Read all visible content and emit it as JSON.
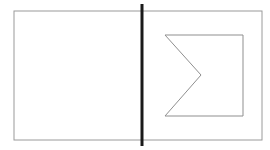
{
  "canvas": {
    "width": 270,
    "height": 150,
    "background_color": "#ffffff",
    "title": "Split rectangle with sigma chevron outline"
  },
  "figure": {
    "outer_rectangle": {
      "label": "outer-frame",
      "x": 14,
      "y": 11,
      "width": 248,
      "height": 129,
      "stroke_color": "#9a9a9a",
      "stroke_width": 1,
      "fill": "none"
    },
    "divider_line": {
      "label": "vertical-divider",
      "x": 142,
      "y_start": 4,
      "y_end": 146,
      "stroke_color": "#1a1a1a",
      "stroke_width": 3,
      "orientation": "vertical"
    },
    "sigma_polygon": {
      "label": "sigma-chevron",
      "points": "165,35 243,35 243,116 165,116 201,75",
      "vertices": [
        {
          "name": "top-left",
          "x": 165,
          "y": 35
        },
        {
          "name": "top-right",
          "x": 243,
          "y": 35
        },
        {
          "name": "bottom-right",
          "x": 243,
          "y": 116
        },
        {
          "name": "bottom-left",
          "x": 165,
          "y": 116
        },
        {
          "name": "notch-tip",
          "x": 201,
          "y": 75
        }
      ],
      "stroke_color": "#8f8f8f",
      "stroke_width": 1,
      "fill": "none",
      "closed": true
    },
    "left_panel": {
      "label": "empty-left-region",
      "x": 14,
      "y": 11,
      "width": 128,
      "height": 129,
      "content": ""
    }
  }
}
